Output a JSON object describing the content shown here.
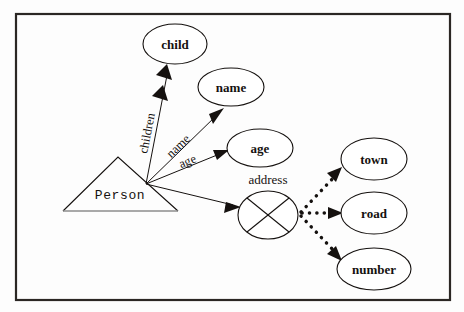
{
  "figure": {
    "kind": "er-attribute-diagram",
    "background_color": "#fdfdfd",
    "ink_color": "#15110f",
    "frame": {
      "x": 16,
      "y": 14,
      "width": 434,
      "height": 286,
      "stroke": "#2b2724"
    }
  },
  "entity": {
    "name": "Person",
    "shape": "triangle",
    "apex": {
      "x": 118,
      "y": 157
    },
    "base_left": {
      "x": 63,
      "y": 211
    },
    "base_right": {
      "x": 178,
      "y": 211
    },
    "label_x": 120,
    "label_y": 199,
    "base_color": "#8d8d8d"
  },
  "attributes": [
    {
      "id": "child",
      "label": "child",
      "shape": "ellipse",
      "cx": 175,
      "cy": 44,
      "rx": 32,
      "ry": 20,
      "edge_label": "children",
      "arrow": "double",
      "edge_from": {
        "x": 146,
        "y": 184
      },
      "edge_to": {
        "x": 168,
        "y": 66
      },
      "edge_label_x": 151,
      "edge_label_y": 134,
      "edge_label_rotation": -79
    },
    {
      "id": "name",
      "label": "name",
      "shape": "ellipse",
      "cx": 231,
      "cy": 87,
      "rx": 33,
      "ry": 19,
      "edge_label": "name",
      "arrow": "single",
      "edge_from": {
        "x": 146,
        "y": 184
      },
      "edge_to": {
        "x": 223,
        "y": 109
      },
      "edge_label_x": 180,
      "edge_label_y": 148,
      "edge_label_rotation": -44
    },
    {
      "id": "age",
      "label": "age",
      "shape": "ellipse",
      "cx": 260,
      "cy": 148,
      "rx": 33,
      "ry": 19,
      "edge_label": "age",
      "arrow": "single",
      "edge_from": {
        "x": 146,
        "y": 184
      },
      "edge_to": {
        "x": 228,
        "y": 151
      },
      "edge_label_x": 188,
      "edge_label_y": 164,
      "edge_label_rotation": -22
    },
    {
      "id": "address",
      "label": "address",
      "shape": "crossed-ellipse",
      "cx": 268,
      "cy": 215,
      "rx": 30,
      "ry": 24,
      "label_x": 268,
      "label_y": 186,
      "label_position": "above",
      "arrow": "single",
      "edge_from": {
        "x": 146,
        "y": 184
      },
      "edge_to": {
        "x": 240,
        "y": 206
      }
    }
  ],
  "composite_components": [
    {
      "id": "town",
      "label": "town",
      "shape": "ellipse",
      "cx": 374,
      "cy": 159,
      "rx": 33,
      "ry": 21,
      "arrow": "single",
      "edge_style": "dotted",
      "edge_from": {
        "x": 300,
        "y": 213
      },
      "edge_to": {
        "x": 341,
        "y": 170
      }
    },
    {
      "id": "road",
      "label": "road",
      "shape": "ellipse",
      "cx": 374,
      "cy": 213,
      "rx": 33,
      "ry": 21,
      "arrow": "single",
      "edge_style": "dotted",
      "edge_from": {
        "x": 300,
        "y": 213
      },
      "edge_to": {
        "x": 341,
        "y": 213
      }
    },
    {
      "id": "number",
      "label": "number",
      "shape": "ellipse",
      "cx": 374,
      "cy": 269,
      "rx": 37,
      "ry": 21,
      "arrow": "single",
      "edge_style": "dotted",
      "edge_from": {
        "x": 300,
        "y": 213
      },
      "edge_to": {
        "x": 341,
        "y": 258
      }
    }
  ]
}
